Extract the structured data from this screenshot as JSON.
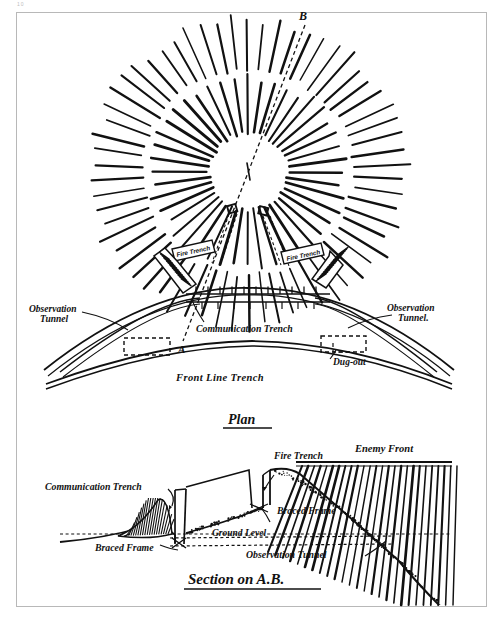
{
  "document": {
    "page_marker": "10",
    "plan_title": "Plan",
    "section_title": "Section on A.B."
  },
  "plan": {
    "section_line_labels": {
      "top": "B",
      "bottom": "A"
    },
    "labels": {
      "fire_trench_left": "Fire Trench",
      "fire_trench_right": "Fire Trench",
      "observation_tunnel_left_line1": "Observation",
      "observation_tunnel_left_line2": "Tunnel",
      "observation_tunnel_right_line1": "Observation",
      "observation_tunnel_right_line2": "Tunnel.",
      "communication_trench": "Communication Trench",
      "dug_out": "Dug-out",
      "front_line_trench": "Front  Line  Trench"
    }
  },
  "section": {
    "labels": {
      "communication_trench": "Communication Trench",
      "braced_frame_left": "Braced Frame",
      "braced_frame_right": "Braced Frame",
      "fire_trench": "Fire Trench",
      "enemy_front": "Enemy Front",
      "ground_level": "Ground Level",
      "observation_tunnel": "Observation Tunnel"
    }
  },
  "style": {
    "ink": "#111111",
    "paper": "#ffffff",
    "frame_border": "#b8b8b8"
  },
  "chart_data": {
    "type": "diagram",
    "crater": {
      "center": [
        248,
        172
      ],
      "inner_ring": {
        "r_start": 40,
        "r_end": 96,
        "ray_count": 44
      },
      "outer_ring": {
        "r_start": 106,
        "r_end": 158,
        "ray_count": 62
      },
      "central_void_rx": 17,
      "central_void_ry": 14
    },
    "sap_heads": [
      [
        232,
        209
      ],
      [
        263,
        211
      ]
    ]
  }
}
